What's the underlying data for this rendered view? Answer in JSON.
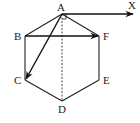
{
  "diagram": {
    "type": "geometry",
    "vertices": [
      "A",
      "B",
      "C",
      "D",
      "E",
      "F"
    ],
    "labels": {
      "A": "A",
      "B": "B",
      "C": "C",
      "D": "D",
      "E": "E",
      "F": "F",
      "X": "X"
    },
    "edges": [
      [
        "A",
        "B"
      ],
      [
        "B",
        "C"
      ],
      [
        "C",
        "D"
      ],
      [
        "D",
        "E"
      ],
      [
        "E",
        "F"
      ],
      [
        "F",
        "A"
      ]
    ],
    "vectors": [
      {
        "from": "A",
        "to": "X",
        "name": "vector-ax"
      },
      {
        "from": "B",
        "to": "F",
        "name": "vector-bf"
      },
      {
        "from": "A",
        "to": "C",
        "name": "vector-ac"
      }
    ],
    "dashed_segments": [
      [
        "A",
        "D"
      ]
    ],
    "right_angle_marks": [
      {
        "at": "A",
        "between": [
          "AX",
          "AD"
        ]
      }
    ]
  }
}
